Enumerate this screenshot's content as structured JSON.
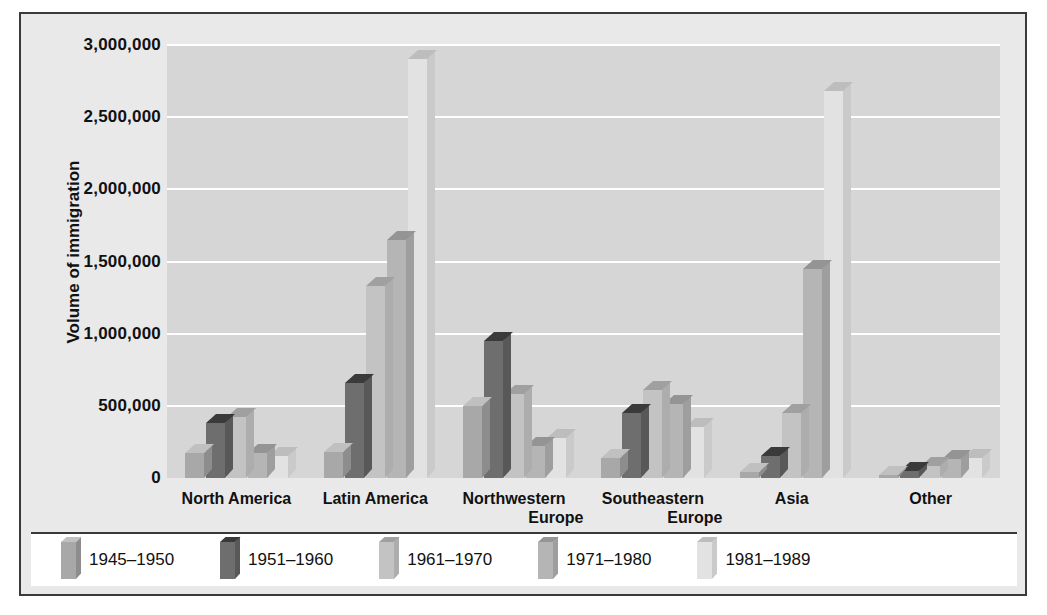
{
  "chart_data": {
    "type": "bar",
    "title": "",
    "xlabel": "",
    "ylabel": "Volume of immigration",
    "ylim": [
      0,
      3000000
    ],
    "grid": true,
    "legend_position": "bottom",
    "ytick_labels": [
      "3,000,000",
      "2,500,000",
      "2,000,000",
      "1,500,000",
      "1,000,000",
      "500,000",
      "0"
    ],
    "ytick_values": [
      3000000,
      2500000,
      2000000,
      1500000,
      1000000,
      500000,
      0
    ],
    "categories": [
      "North America",
      "Latin America",
      "Northwestern Europe",
      "Southeastern Europe",
      "Asia",
      "Other"
    ],
    "category_lines": [
      [
        "North America"
      ],
      [
        "Latin America"
      ],
      [
        "Northwestern",
        "Europe"
      ],
      [
        "Southeastern",
        "Europe"
      ],
      [
        "Asia"
      ],
      [
        "Other"
      ]
    ],
    "series": [
      {
        "name": "1945–1950",
        "color": "#a8a8a8",
        "top_color": "#c0c0c0",
        "side_color": "#8d8d8d",
        "values": [
          170000,
          180000,
          500000,
          140000,
          40000,
          20000
        ]
      },
      {
        "name": "1951–1960",
        "color": "#6e6e6e",
        "top_color": "#3a3a3a",
        "side_color": "#585858",
        "values": [
          380000,
          660000,
          950000,
          450000,
          150000,
          50000
        ]
      },
      {
        "name": "1961–1970",
        "color": "#c3c3c3",
        "top_color": "#a0a0a0",
        "side_color": "#adadad",
        "values": [
          420000,
          1330000,
          580000,
          610000,
          450000,
          80000
        ]
      },
      {
        "name": "1971–1980",
        "color": "#b5b5b5",
        "top_color": "#949494",
        "side_color": "#9e9e9e",
        "values": [
          170000,
          1650000,
          220000,
          510000,
          1450000,
          130000
        ]
      },
      {
        "name": "1981–1989",
        "color": "#e2e2e2",
        "top_color": "#bdbdbd",
        "side_color": "#cacaca",
        "values": [
          150000,
          2900000,
          280000,
          350000,
          2680000,
          140000
        ]
      }
    ]
  },
  "colors": {
    "page_background": "#ffffff",
    "panel_background": "#e9e9e9",
    "panel_border": "#3a3a3a",
    "plot_background": "#d6d6d6",
    "gridline": "#ffffff",
    "text": "#111111",
    "legend_background": "#ffffff"
  }
}
